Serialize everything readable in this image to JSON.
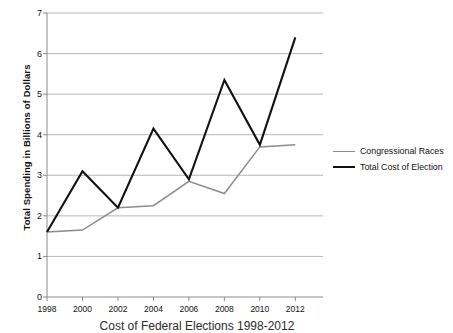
{
  "chart_data": {
    "type": "line",
    "title": "Cost of Federal Elections 1998-2012",
    "xlabel": "",
    "ylabel": "Total Spending in Billions of Dollars",
    "x": [
      1998,
      2000,
      2002,
      2004,
      2006,
      2008,
      2010,
      2012
    ],
    "categories": [
      "1998",
      "2000",
      "2002",
      "2004",
      "2006",
      "2008",
      "2010",
      "2012"
    ],
    "series": [
      {
        "name": "Congressional Races",
        "color": "#8c8c8c",
        "values": [
          1.6,
          1.65,
          2.2,
          2.25,
          2.85,
          2.55,
          3.7,
          3.75
        ]
      },
      {
        "name": "Total Cost of Election",
        "color": "#111111",
        "values": [
          1.6,
          3.1,
          2.2,
          4.15,
          2.9,
          5.35,
          3.75,
          6.4
        ]
      }
    ],
    "ylim": [
      0,
      7
    ],
    "yticks": [
      0,
      1,
      2,
      3,
      4,
      5,
      6,
      7
    ],
    "ytick_labels": [
      "0",
      "1",
      "2",
      "3",
      "4",
      "5",
      "6",
      "7"
    ],
    "grid": true,
    "grid_axis": "y",
    "grid_color": "#b0b0b0",
    "legend_position": "right"
  },
  "axes": {
    "y_title": "Total Spending in Billions of Dollars"
  },
  "legend": {
    "items": [
      {
        "label": "Congressional Races"
      },
      {
        "label": "Total Cost of Election"
      }
    ]
  },
  "caption": {
    "text": "Cost of Federal Elections 1998-2012"
  }
}
